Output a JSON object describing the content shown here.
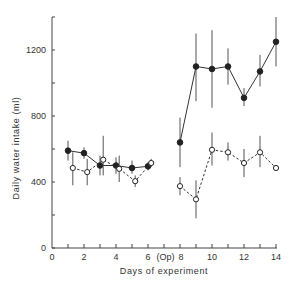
{
  "chart_data": {
    "type": "line",
    "title": "",
    "xlabel": "Days of experiment",
    "ylabel": "Daily water intake (ml)",
    "xlim": [
      0,
      14
    ],
    "ylim": [
      0,
      1400
    ],
    "x_ticks": [
      0,
      2,
      4,
      6,
      8,
      10,
      12,
      14
    ],
    "x_tick_labels": [
      "0",
      "2",
      "4",
      "6",
      "(Op)",
      "8",
      "10",
      "12",
      "14"
    ],
    "y_ticks": [
      0,
      400,
      800,
      1200
    ],
    "y_tick_labels": [
      "0",
      "400",
      "800",
      "1200"
    ],
    "annotation": "(Op)",
    "annotation_x": 7,
    "grid": false,
    "series": [
      {
        "name": "filled",
        "marker": "filled-circle",
        "line": "solid",
        "segments": [
          {
            "x": [
              1,
              2,
              3,
              4,
              5,
              6
            ],
            "y": [
              590,
              575,
              500,
              500,
              485,
              495
            ],
            "err_low": [
              530,
              540,
              440,
              450,
              450,
              470
            ],
            "err_high": [
              650,
              610,
              560,
              550,
              530,
              520
            ]
          },
          {
            "x": [
              8,
              9,
              10,
              11,
              12,
              13,
              14
            ],
            "y": [
              640,
              1100,
              1085,
              1100,
              910,
              1070,
              1250
            ],
            "err_low": [
              490,
              890,
              850,
              990,
              860,
              980,
              1100
            ],
            "err_high": [
              790,
              1300,
              1320,
              1210,
              970,
              1170,
              1400
            ]
          }
        ]
      },
      {
        "name": "open",
        "marker": "open-circle",
        "line": "dashed",
        "segments": [
          {
            "x": [
              1.3,
              2.2,
              3.2,
              4.2,
              5.2,
              6.2
            ],
            "y": [
              485,
              460,
              535,
              480,
              405,
              515
            ],
            "err_low": [
              380,
              380,
              440,
              400,
              370,
              490
            ],
            "err_high": [
              580,
              540,
              680,
              560,
              440,
              540
            ]
          },
          {
            "x": [
              8,
              9,
              10,
              11,
              12,
              13,
              14
            ],
            "y": [
              375,
              295,
              595,
              580,
              515,
              580,
              485
            ],
            "err_low": [
              320,
              180,
              500,
              530,
              430,
              490,
              485
            ],
            "err_high": [
              430,
              410,
              700,
              640,
              600,
              680,
              485
            ]
          }
        ]
      }
    ]
  }
}
